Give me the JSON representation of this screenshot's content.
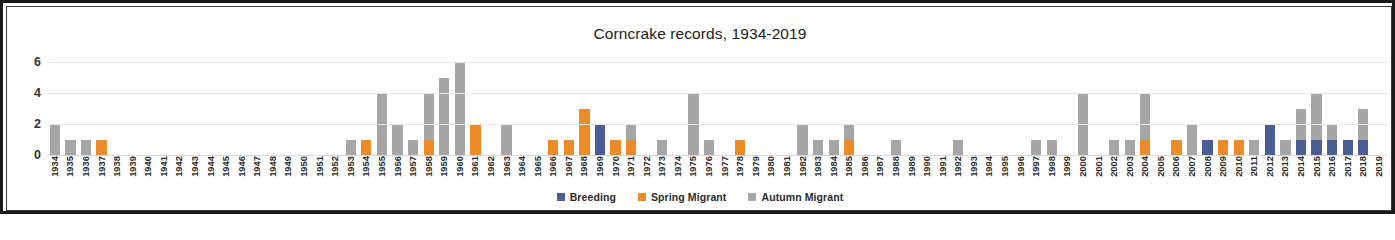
{
  "chart_data": {
    "type": "bar",
    "title": "Corncrake records, 1934-2019",
    "xlabel": "",
    "ylabel": "",
    "ylim": [
      0,
      7
    ],
    "yticks": [
      0,
      2,
      4,
      6
    ],
    "grid": true,
    "stacked": true,
    "legend_position": "bottom",
    "categories": [
      "1934",
      "1935",
      "1936",
      "1937",
      "1938",
      "1939",
      "1940",
      "1941",
      "1942",
      "1943",
      "1944",
      "1945",
      "1946",
      "1947",
      "1948",
      "1949",
      "1950",
      "1951",
      "1952",
      "1953",
      "1954",
      "1955",
      "1956",
      "1957",
      "1958",
      "1959",
      "1960",
      "1961",
      "1962",
      "1963",
      "1964",
      "1965",
      "1966",
      "1967",
      "1968",
      "1969",
      "1970",
      "1971",
      "1972",
      "1973",
      "1974",
      "1975",
      "1976",
      "1977",
      "1978",
      "1979",
      "1980",
      "1981",
      "1982",
      "1983",
      "1984",
      "1985",
      "1986",
      "1987",
      "1988",
      "1989",
      "1990",
      "1991",
      "1992",
      "1993",
      "1994",
      "1995",
      "1996",
      "1997",
      "1998",
      "1999",
      "2000",
      "2001",
      "2002",
      "2003",
      "2004",
      "2005",
      "2006",
      "2007",
      "2008",
      "2009",
      "2010",
      "2011",
      "2012",
      "2013",
      "2014",
      "2015",
      "2016",
      "2017",
      "2018",
      "2019"
    ],
    "series": [
      {
        "name": "Breeding",
        "color": "#4a5d94",
        "values": [
          0,
          0,
          0,
          0,
          0,
          0,
          0,
          0,
          0,
          0,
          0,
          0,
          0,
          0,
          0,
          0,
          0,
          0,
          0,
          0,
          0,
          0,
          0,
          0,
          0,
          0,
          0,
          0,
          0,
          0,
          0,
          0,
          0,
          0,
          0,
          2,
          0,
          0,
          0,
          0,
          0,
          0,
          0,
          0,
          0,
          0,
          0,
          0,
          0,
          0,
          0,
          0,
          0,
          0,
          0,
          0,
          0,
          0,
          0,
          0,
          0,
          0,
          0,
          0,
          0,
          0,
          0,
          0,
          0,
          0,
          0,
          0,
          0,
          0,
          1,
          0,
          0,
          0,
          2,
          0,
          1,
          1,
          1,
          1,
          1,
          0
        ]
      },
      {
        "name": "Spring Migrant",
        "color": "#ed8b28",
        "values": [
          0,
          0,
          0,
          1,
          0,
          0,
          0,
          0,
          0,
          0,
          0,
          0,
          0,
          0,
          0,
          0,
          0,
          0,
          0,
          0,
          1,
          0,
          0,
          0,
          1,
          0,
          0,
          2,
          0,
          0,
          0,
          0,
          1,
          1,
          3,
          0,
          1,
          1,
          0,
          0,
          0,
          0,
          0,
          0,
          1,
          0,
          0,
          0,
          0,
          0,
          0,
          1,
          0,
          0,
          0,
          0,
          0,
          0,
          0,
          0,
          0,
          0,
          0,
          0,
          0,
          0,
          0,
          0,
          0,
          0,
          1,
          0,
          1,
          0,
          0,
          1,
          1,
          0,
          0,
          0,
          0,
          0,
          0,
          0,
          0,
          0
        ]
      },
      {
        "name": "Autumn Migrant",
        "color": "#a6a6a6",
        "values": [
          2,
          1,
          1,
          0,
          0,
          0,
          0,
          0,
          0,
          0,
          0,
          0,
          0,
          0,
          0,
          0,
          0,
          0,
          0,
          1,
          0,
          4,
          2,
          1,
          3,
          5,
          6,
          0,
          0,
          2,
          0,
          0,
          0,
          0,
          0,
          0,
          0,
          1,
          0,
          1,
          0,
          4,
          1,
          0,
          0,
          0,
          0,
          0,
          2,
          1,
          1,
          1,
          0,
          0,
          1,
          0,
          0,
          0,
          1,
          0,
          0,
          0,
          0,
          1,
          1,
          0,
          4,
          0,
          1,
          1,
          3,
          0,
          0,
          2,
          0,
          0,
          0,
          1,
          0,
          1,
          2,
          3,
          1,
          0,
          2,
          0
        ]
      }
    ]
  },
  "legend": {
    "items": [
      {
        "label": "Breeding",
        "color": "#4a5d94"
      },
      {
        "label": "Spring Migrant",
        "color": "#ed8b28"
      },
      {
        "label": "Autumn Migrant",
        "color": "#a6a6a6"
      }
    ]
  }
}
